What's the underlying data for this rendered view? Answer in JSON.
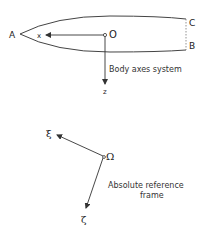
{
  "diagram": {
    "body_frame": {
      "points": {
        "nose": "A",
        "top_stern": "C",
        "bottom_stern": "B",
        "origin": "O"
      },
      "axes": {
        "x": "x",
        "z": "z"
      },
      "caption": "Body axes system"
    },
    "absolute_frame": {
      "origin": "Ω",
      "axes": {
        "xi": "ξ",
        "zeta": "ζ"
      },
      "caption_line1": "Absolute reference",
      "caption_line2": "frame"
    },
    "colors": {
      "line": "#333333",
      "background": "#ffffff"
    }
  }
}
